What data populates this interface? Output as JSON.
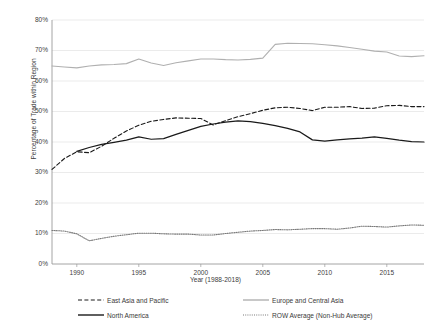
{
  "chart_data": {
    "type": "line",
    "title": "",
    "xlabel": "Year (1988-2018)",
    "ylabel": "Percentage of Trade within Region",
    "xlim": [
      1988,
      2018
    ],
    "ylim": [
      0,
      80
    ],
    "grid": true,
    "legend_position": "bottom",
    "x_ticks": [
      "1990",
      "1995",
      "2000",
      "2005",
      "2010",
      "2015"
    ],
    "x_tick_values": [
      1990,
      1995,
      2000,
      2005,
      2010,
      2015
    ],
    "y_ticks": [
      "0%",
      "10%",
      "20%",
      "30%",
      "40%",
      "50%",
      "60%",
      "70%",
      "80%"
    ],
    "y_tick_values": [
      0,
      10,
      20,
      30,
      40,
      50,
      60,
      70,
      80
    ],
    "x": [
      1988,
      1989,
      1990,
      1991,
      1992,
      1993,
      1994,
      1995,
      1996,
      1997,
      1998,
      1999,
      2000,
      2001,
      2002,
      2003,
      2004,
      2005,
      2006,
      2007,
      2008,
      2009,
      2010,
      2011,
      2012,
      2013,
      2014,
      2015,
      2016,
      2017,
      2018
    ],
    "series": [
      {
        "name": "East Asia and Pacific",
        "style": "dashed",
        "color": "#1a1a1a",
        "values": [
          31.0,
          34.6,
          36.8,
          36.5,
          38.6,
          41.2,
          43.6,
          45.5,
          46.8,
          47.4,
          47.9,
          47.8,
          47.7,
          45.6,
          47.0,
          48.3,
          49.3,
          50.4,
          51.2,
          51.4,
          51.0,
          50.3,
          51.4,
          51.4,
          51.6,
          51.0,
          51.1,
          51.9,
          52.0,
          51.6,
          51.6
        ]
      },
      {
        "name": "Europe and Central Asia",
        "style": "solid",
        "color": "#b0b0b0",
        "values": [
          64.9,
          64.6,
          64.3,
          64.9,
          65.3,
          65.4,
          65.7,
          67.2,
          65.9,
          65.1,
          66.0,
          66.6,
          67.2,
          67.2,
          67.0,
          66.9,
          67.1,
          67.5,
          72.0,
          72.4,
          72.3,
          72.2,
          71.9,
          71.5,
          71.0,
          70.4,
          69.8,
          69.5,
          68.2,
          68.0,
          68.3
        ]
      },
      {
        "name": "North America",
        "style": "solid",
        "color": "#1a1a1a",
        "values": [
          null,
          null,
          36.9,
          38.2,
          39.2,
          39.9,
          40.6,
          41.7,
          40.9,
          41.1,
          42.5,
          43.8,
          45.1,
          45.9,
          46.5,
          46.9,
          46.7,
          46.1,
          45.4,
          44.5,
          43.3,
          40.7,
          40.3,
          40.7,
          41.0,
          41.3,
          41.7,
          41.2,
          40.6,
          40.1,
          40.0
        ]
      },
      {
        "name": "ROW Average (Non-Hub Average)",
        "style": "dotted",
        "color": "#7a7a7a",
        "values": [
          11.0,
          10.8,
          9.9,
          7.6,
          8.4,
          9.1,
          9.6,
          10.1,
          10.1,
          9.9,
          9.8,
          9.8,
          9.5,
          9.5,
          10.0,
          10.4,
          10.8,
          11.0,
          11.3,
          11.2,
          11.4,
          11.6,
          11.6,
          11.4,
          11.8,
          12.4,
          12.3,
          12.1,
          12.5,
          12.8,
          12.7
        ]
      }
    ]
  },
  "legend": {
    "items": [
      {
        "label": "East Asia and Pacific",
        "style": "dashed",
        "color": "#1a1a1a"
      },
      {
        "label": "Europe and Central Asia",
        "style": "solid",
        "color": "#b0b0b0"
      },
      {
        "label": "North America",
        "style": "solid",
        "color": "#1a1a1a"
      },
      {
        "label": "ROW Average (Non-Hub Average)",
        "style": "dotted",
        "color": "#7a7a7a"
      }
    ]
  },
  "colors": {
    "gridline": "#e2e2e2",
    "axis": "#9a9a9a",
    "text": "#3a3a3a",
    "background": "#ffffff"
  }
}
